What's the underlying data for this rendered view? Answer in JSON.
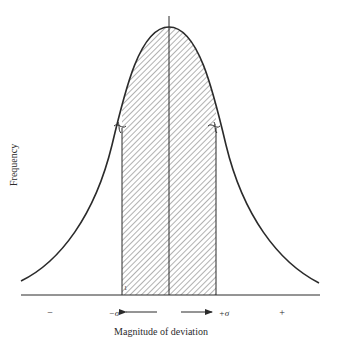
{
  "figure": {
    "type": "normal-distribution-diagram",
    "y_axis_label": "Frequency",
    "x_axis_label": "Magnitude of deviation",
    "labels": {
      "minus_sign": "−",
      "plus_sign": "+",
      "minus_sigma": "−σ",
      "plus_sigma": "+σ"
    },
    "shaded_region": "±σ (hatched)",
    "inflection_markers": 2,
    "colors": {
      "line": "#2b2b2b",
      "hatch": "#555555",
      "background": "#ffffff"
    }
  }
}
